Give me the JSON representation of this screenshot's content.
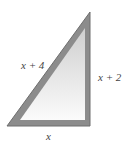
{
  "diagram": {
    "type": "right-triangle",
    "labels": {
      "hypotenuse": "x + 4",
      "vertical_leg": "x + 2",
      "base": "x"
    },
    "colors": {
      "border": "#8c8c8c",
      "border_dark": "#6e6e6e",
      "fill_top": "#d4d4d4",
      "fill_bottom": "#fafafa"
    }
  }
}
